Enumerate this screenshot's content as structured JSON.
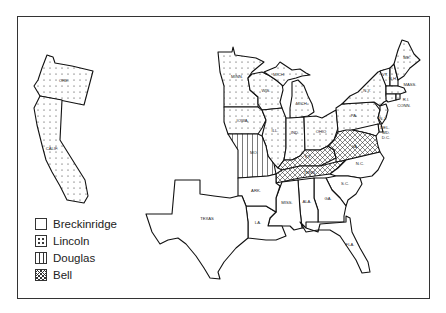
{
  "map": {
    "subject": "1860 U.S. presidential election results by state",
    "colors": {
      "outline": "#111111",
      "background": "#ffffff"
    },
    "states": [
      {
        "abbr": "ORE.",
        "candidate": "Lincoln"
      },
      {
        "abbr": "CALIF.",
        "candidate": "Lincoln"
      },
      {
        "abbr": "MINN.",
        "candidate": "Lincoln"
      },
      {
        "abbr": "WIS.",
        "candidate": "Lincoln"
      },
      {
        "abbr": "MICH.",
        "candidate": "Lincoln"
      },
      {
        "abbr": "MICH.",
        "candidate": "Lincoln",
        "note": "Upper Peninsula"
      },
      {
        "abbr": "IOWA",
        "candidate": "Lincoln"
      },
      {
        "abbr": "ILL.",
        "candidate": "Lincoln"
      },
      {
        "abbr": "IND.",
        "candidate": "Lincoln"
      },
      {
        "abbr": "OHIO",
        "candidate": "Lincoln"
      },
      {
        "abbr": "PA.",
        "candidate": "Lincoln"
      },
      {
        "abbr": "N.Y.",
        "candidate": "Lincoln"
      },
      {
        "abbr": "VT.",
        "candidate": "Lincoln"
      },
      {
        "abbr": "N.H.",
        "candidate": "Lincoln"
      },
      {
        "abbr": "ME.",
        "candidate": "Lincoln"
      },
      {
        "abbr": "MASS.",
        "candidate": "Lincoln"
      },
      {
        "abbr": "R.I.",
        "candidate": "Lincoln"
      },
      {
        "abbr": "CONN.",
        "candidate": "Lincoln"
      },
      {
        "abbr": "N.J.",
        "candidate": "Lincoln"
      },
      {
        "abbr": "MO.",
        "candidate": "Douglas"
      },
      {
        "abbr": "KY.",
        "candidate": "Bell"
      },
      {
        "abbr": "TENN.",
        "candidate": "Bell"
      },
      {
        "abbr": "VA.",
        "candidate": "Bell"
      },
      {
        "abbr": "DEL.",
        "candidate": "Breckinridge"
      },
      {
        "abbr": "MD.",
        "candidate": "Breckinridge"
      },
      {
        "abbr": "D.C.",
        "candidate": "Breckinridge"
      },
      {
        "abbr": "N.C.",
        "candidate": "Breckinridge"
      },
      {
        "abbr": "S.C.",
        "candidate": "Breckinridge"
      },
      {
        "abbr": "GA.",
        "candidate": "Breckinridge"
      },
      {
        "abbr": "ALA.",
        "candidate": "Breckinridge"
      },
      {
        "abbr": "MISS.",
        "candidate": "Breckinridge"
      },
      {
        "abbr": "LA.",
        "candidate": "Breckinridge"
      },
      {
        "abbr": "ARK.",
        "candidate": "Breckinridge"
      },
      {
        "abbr": "TEXAS",
        "candidate": "Breckinridge"
      },
      {
        "abbr": "FLA.",
        "candidate": "Breckinridge"
      }
    ],
    "labels": {
      "ore": "ORE.",
      "calif": "CALIF.",
      "minn": "MINN.",
      "wis": "WIS.",
      "mich_up": "MICH.",
      "mich": "MICH.",
      "iowa": "IOWA",
      "ill": "ILL.",
      "ind": "IND.",
      "ohio": "OHIO",
      "pa": "PA.",
      "ny": "N.Y.",
      "vt": "VT.",
      "nh": "N.H.",
      "me": "ME.",
      "mass": "MASS.",
      "ri": "R.I.",
      "conn": "CONN.",
      "nj": "N.J.",
      "del": "DEL.",
      "md": "MD.",
      "dc": "D.C.",
      "va": "VA.",
      "mo": "MO.",
      "ky": "KY.",
      "tenn": "TENN.",
      "nc": "N.C.",
      "sc": "S.C.",
      "ga": "GA.",
      "ala": "ALA.",
      "miss": "MISS.",
      "la": "LA.",
      "ark": "ARK.",
      "texas": "TEXAS",
      "fla": "FLA."
    }
  },
  "legend": {
    "items": [
      {
        "label": "Breckinridge",
        "pattern": "blank"
      },
      {
        "label": "Lincoln",
        "pattern": "dots"
      },
      {
        "label": "Douglas",
        "pattern": "vertical-lines"
      },
      {
        "label": "Bell",
        "pattern": "crosshatch"
      }
    ]
  }
}
